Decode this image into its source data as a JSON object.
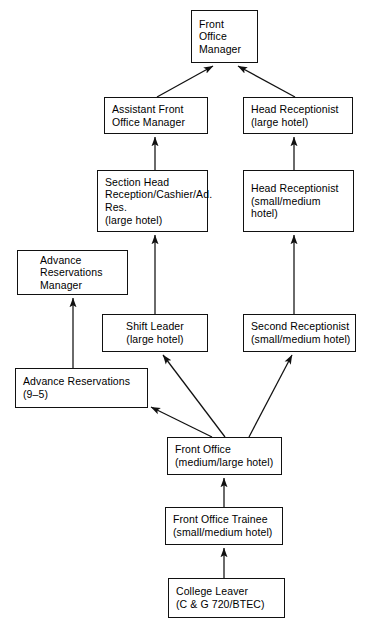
{
  "diagram": {
    "line_color": "#111111",
    "box_fill": "#ffffff",
    "nodes": [
      {
        "id": "front-office-manager",
        "label": "Front\nOffice\nManager",
        "x": 191,
        "y": 10,
        "w": 67,
        "h": 53,
        "align": "left",
        "pad": "pad-l"
      },
      {
        "id": "assistant-front-office-manager",
        "label": "Assistant Front\nOffice Manager",
        "x": 104,
        "y": 97,
        "w": 104,
        "h": 37,
        "align": "left",
        "pad": "pad-l"
      },
      {
        "id": "head-receptionist-large",
        "label": "Head Receptionist\n(large hotel)",
        "x": 243,
        "y": 97,
        "w": 110,
        "h": 37,
        "align": "left",
        "pad": "pad-l"
      },
      {
        "id": "section-head-reception",
        "label": "Section Head\nReception/Cashier/Ad.\nRes.\n(large hotel)",
        "x": 97,
        "y": 170,
        "w": 111,
        "h": 62,
        "align": "left",
        "pad": "pad-l"
      },
      {
        "id": "head-receptionist-small-medium",
        "label": "Head Receptionist\n(small/medium hotel)",
        "x": 243,
        "y": 170,
        "w": 111,
        "h": 62,
        "align": "left",
        "pad": "pad-l"
      },
      {
        "id": "advance-reservations-manager",
        "label": "Advance\nReservations\nManager",
        "x": 17,
        "y": 250,
        "w": 111,
        "h": 45,
        "align": "left",
        "pad": "pad-i"
      },
      {
        "id": "shift-leader",
        "label": "Shift Leader\n(large hotel)",
        "x": 102,
        "y": 314,
        "w": 106,
        "h": 38,
        "align": "center",
        "pad": "pad-c"
      },
      {
        "id": "second-receptionist",
        "label": "Second Receptionist\n(small/medium hotel)",
        "x": 243,
        "y": 314,
        "w": 113,
        "h": 38,
        "align": "left",
        "pad": "pad-l"
      },
      {
        "id": "advance-reservations",
        "label": "Advance Reservations\n(9–5)",
        "x": 15,
        "y": 368,
        "w": 133,
        "h": 40,
        "align": "left",
        "pad": "pad-l"
      },
      {
        "id": "front-office",
        "label": "Front Office\n(medium/large hotel)",
        "x": 167,
        "y": 437,
        "w": 115,
        "h": 38,
        "align": "left",
        "pad": "pad-l"
      },
      {
        "id": "front-office-trainee",
        "label": "Front Office Trainee\n(small/medium hotel)",
        "x": 165,
        "y": 507,
        "w": 118,
        "h": 38,
        "align": "left",
        "pad": "pad-l"
      },
      {
        "id": "college-leaver",
        "label": "College Leaver\n(C & G 720/BTEC)",
        "x": 168,
        "y": 578,
        "w": 117,
        "h": 40,
        "align": "left",
        "pad": "pad-l"
      }
    ],
    "connectors": [
      {
        "id": "assistant-to-manager",
        "x1": 157,
        "y1": 97,
        "x2": 213,
        "y2": 66
      },
      {
        "id": "head-receptionist-to-manager",
        "x1": 295,
        "y1": 97,
        "x2": 238,
        "y2": 66
      },
      {
        "id": "section-head-to-assistant",
        "x1": 155,
        "y1": 170,
        "x2": 155,
        "y2": 137
      },
      {
        "id": "head-rec-small-to-large",
        "x1": 294,
        "y1": 170,
        "x2": 294,
        "y2": 137
      },
      {
        "id": "shift-leader-to-section-head",
        "x1": 155,
        "y1": 314,
        "x2": 155,
        "y2": 235
      },
      {
        "id": "second-rec-to-head-rec",
        "x1": 294,
        "y1": 314,
        "x2": 294,
        "y2": 235
      },
      {
        "id": "adv-res-to-adv-res-manager",
        "x1": 73,
        "y1": 368,
        "x2": 73,
        "y2": 298
      },
      {
        "id": "front-office-to-shift-leader",
        "x1": 225,
        "y1": 437,
        "x2": 163,
        "y2": 355
      },
      {
        "id": "front-office-to-second-rec",
        "x1": 249,
        "y1": 437,
        "x2": 292,
        "y2": 355
      },
      {
        "id": "front-office-to-adv-res",
        "x1": 212,
        "y1": 437,
        "x2": 151,
        "y2": 407
      },
      {
        "id": "trainee-to-front-office",
        "x1": 224,
        "y1": 507,
        "x2": 224,
        "y2": 478
      },
      {
        "id": "college-leaver-to-trainee",
        "x1": 224,
        "y1": 578,
        "x2": 224,
        "y2": 548
      }
    ]
  }
}
